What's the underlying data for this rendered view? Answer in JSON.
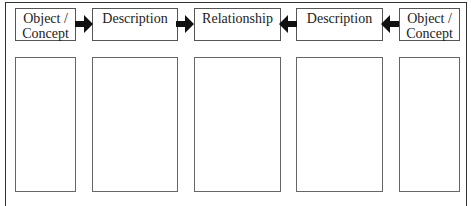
{
  "diagram": {
    "headers": [
      {
        "label": "Object / Concept"
      },
      {
        "label": "Description"
      },
      {
        "label": "Relationship"
      },
      {
        "label": "Description"
      },
      {
        "label": "Object / Concept"
      }
    ],
    "arrows": [
      {
        "direction": "right",
        "icon": "arrow-right-icon"
      },
      {
        "direction": "right",
        "icon": "arrow-right-icon"
      },
      {
        "direction": "left",
        "icon": "arrow-left-icon"
      },
      {
        "direction": "left",
        "icon": "arrow-left-icon"
      }
    ],
    "content_boxes": [
      "",
      "",
      "",
      "",
      ""
    ],
    "colors": {
      "border": "#333333",
      "arrow": "#111111"
    }
  }
}
